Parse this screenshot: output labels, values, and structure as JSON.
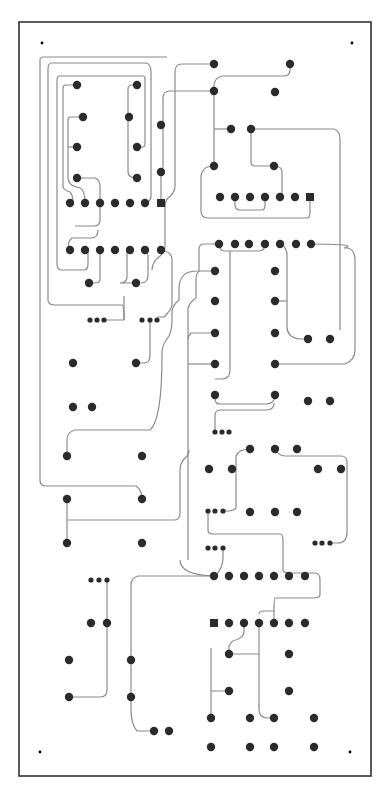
{
  "diagram": {
    "type": "pcb-layout",
    "board": {
      "x": 19,
      "y": 22,
      "w": 352,
      "h": 754,
      "stroke": "#333333"
    },
    "colors": {
      "pad": "#2b2b2b",
      "trace": "#8a8a8a",
      "background": "#ffffff"
    },
    "mount_holes": [
      [
        42,
        43
      ],
      [
        352,
        43
      ],
      [
        40,
        752
      ],
      [
        350,
        752
      ]
    ],
    "pads_round": [
      [
        77,
        85
      ],
      [
        137,
        85
      ],
      [
        83,
        117
      ],
      [
        129,
        117
      ],
      [
        77,
        147
      ],
      [
        137,
        147
      ],
      [
        77,
        178
      ],
      [
        137,
        178
      ],
      [
        70,
        203
      ],
      [
        85,
        203
      ],
      [
        100,
        203
      ],
      [
        115,
        203
      ],
      [
        130,
        203
      ],
      [
        145,
        203
      ],
      [
        161,
        125
      ],
      [
        161,
        172
      ],
      [
        70,
        250
      ],
      [
        85,
        250
      ],
      [
        100,
        250
      ],
      [
        115,
        250
      ],
      [
        130,
        250
      ],
      [
        145,
        250
      ],
      [
        161,
        250
      ],
      [
        89,
        283
      ],
      [
        136,
        283
      ],
      [
        73,
        363
      ],
      [
        136,
        363
      ],
      [
        73,
        407
      ],
      [
        92,
        407
      ],
      [
        214,
        64
      ],
      [
        290,
        64
      ],
      [
        214,
        91
      ],
      [
        275,
        92
      ],
      [
        231,
        129
      ],
      [
        251,
        129
      ],
      [
        214,
        166
      ],
      [
        274,
        166
      ],
      [
        220,
        197
      ],
      [
        235,
        197
      ],
      [
        250,
        197
      ],
      [
        265,
        197
      ],
      [
        280,
        197
      ],
      [
        295,
        197
      ],
      [
        219,
        244
      ],
      [
        235,
        244
      ],
      [
        249,
        244
      ],
      [
        265,
        244
      ],
      [
        280,
        244
      ],
      [
        296,
        244
      ],
      [
        311,
        244
      ],
      [
        215,
        271
      ],
      [
        275,
        271
      ],
      [
        215,
        301
      ],
      [
        275,
        301
      ],
      [
        215,
        333
      ],
      [
        275,
        333
      ],
      [
        308,
        339
      ],
      [
        330,
        339
      ],
      [
        215,
        364
      ],
      [
        275,
        364
      ],
      [
        215,
        395
      ],
      [
        275,
        395
      ],
      [
        308,
        401
      ],
      [
        330,
        401
      ],
      [
        67,
        456
      ],
      [
        142,
        456
      ],
      [
        67,
        499
      ],
      [
        142,
        499
      ],
      [
        67,
        543
      ],
      [
        142,
        543
      ],
      [
        250,
        449
      ],
      [
        275,
        449
      ],
      [
        297,
        449
      ],
      [
        209,
        469
      ],
      [
        232,
        469
      ],
      [
        318,
        469
      ],
      [
        341,
        469
      ],
      [
        250,
        512
      ],
      [
        275,
        512
      ],
      [
        297,
        512
      ],
      [
        214,
        576
      ],
      [
        229,
        576
      ],
      [
        244,
        576
      ],
      [
        259,
        576
      ],
      [
        274,
        576
      ],
      [
        289,
        576
      ],
      [
        305,
        576
      ],
      [
        91,
        623
      ],
      [
        107,
        623
      ],
      [
        69,
        660
      ],
      [
        131,
        660
      ],
      [
        69,
        697
      ],
      [
        131,
        697
      ],
      [
        154,
        731
      ],
      [
        169,
        731
      ],
      [
        229,
        623
      ],
      [
        244,
        623
      ],
      [
        259,
        623
      ],
      [
        274,
        623
      ],
      [
        289,
        623
      ],
      [
        305,
        623
      ],
      [
        229,
        654
      ],
      [
        289,
        654
      ],
      [
        229,
        691
      ],
      [
        289,
        691
      ],
      [
        211,
        718
      ],
      [
        250,
        718
      ],
      [
        274,
        718
      ],
      [
        314,
        718
      ],
      [
        211,
        747
      ],
      [
        250,
        747
      ],
      [
        274,
        747
      ],
      [
        314,
        747
      ]
    ],
    "pads_square": [
      [
        161,
        203
      ],
      [
        310,
        197
      ],
      [
        214,
        623
      ]
    ],
    "pads_small": [
      [
        90,
        320
      ],
      [
        97,
        320
      ],
      [
        104,
        320
      ],
      [
        142,
        320
      ],
      [
        150,
        320
      ],
      [
        157,
        320
      ],
      [
        215,
        432
      ],
      [
        222,
        432
      ],
      [
        229,
        432
      ],
      [
        208,
        511
      ],
      [
        215,
        511
      ],
      [
        223,
        511
      ],
      [
        315,
        543
      ],
      [
        322,
        543
      ],
      [
        330,
        543
      ],
      [
        208,
        548
      ],
      [
        215,
        548
      ],
      [
        223,
        548
      ],
      [
        91,
        580
      ],
      [
        99,
        580
      ],
      [
        107,
        580
      ]
    ],
    "traces": [
      "M77,85 H66 Q63,85 63,88 V186 Q63,190 70,192 Q73,195 73,203",
      "M83,117 H71 Q68,117 68,120 V178 Q68,186 80,188 Q85,190 85,203",
      "M77,147 H68",
      "M77,178 H95 Q100,180 100,186 V220 Q100,226 94,226 H75",
      "M137,85 H132 Q128,85 128,89 V172 Q128,178 137,178",
      "M137,147 H143 Q145,147 145,143 V78 Q145,76 142,76 H60 Q57,76 57,80 V264 Q57,270 62,270 H84 Q88,270 88,264 V250",
      "M161,172 V203",
      "M145,203 Q151,202 151,196 V72 Q151,63 145,63 H52 Q48,63 48,69 V300 Q48,305 55,305 H122 Q124,305 124,320",
      "M161,125 V125",
      "M214,64 H182 Q175,64 175,72 V186 Q175,193 168,198 Q165,201 165,208 V246 Q165,252 160,256 Q152,262 152,270",
      "M214,91 H170 Q163,91 163,98 V168",
      "M290,64 V70 Q290,76 284,76 H222 Q214,78 214,86 V166",
      "M214,129 H231",
      "M251,129 H334 Q340,131 340,139 V330",
      "M251,129 V162 Q251,166 255,166 H274 Q282,166 282,172 V197",
      "M214,166 Q201,166 201,178 V211 Q201,218 208,218 H307 Q310,218 310,212 V197",
      "M235,197 V205 Q235,210 240,210 H262 Q265,210 265,205 V197",
      "M130,250 Q127,250 127,253 V277 Q127,283 120,283 H136",
      "M100,250 V280 Q100,283 94,283 H89",
      "M70,250 Q66,243 72,238 H91 Q98,238 98,230",
      "M145,250 Q148,250 148,258 V275 Q148,283 141,283",
      "M161,250 Q172,252 172,259 V305 Q172,309 164,317 H157",
      "M104,320 H124 V296",
      "M150,320 V355 Q150,363 144,363 H136",
      "M219,244 Q219,251 225,251 H259 Q265,251 265,244",
      "M230,251 V370 Q230,379 222,379 H215 M219,244 H204 Q200,244 199,248 V271 Q186,271 183,276 Q179,281 179,289 V300 Q173,305 172,311 V320 Q172,330 169,336 Q162,345 162,352 V355 Q162,420 150,430 H75 Q67,432 67,440 V456",
      "M215,271 H200 Q196,272 196,280 V298 Q190,302 188,308 V560",
      "M215,333 H191 Q188,336 188,340",
      "M215,364 H188",
      "M281,244 Q287,248 287,255 V327 Q287,337 299,339 H308",
      "M275,301 H287",
      "M311,244 Q360,244 344,248 H348 Q355,250 355,260 V350 Q355,360 345,364 H275",
      "M215,395 V399 Q215,404 220,404 H266 Q275,404 275,395",
      "M215,432 V415 Q215,410 221,410 H266 Q274,410 274,403",
      "M250,449 Q239,449 236,456 V507 Q236,510 229,511 H223",
      "M275,449 Q279,456 285,456 H341 Q347,456 347,462 V532 Q347,543 338,543 H330",
      "M208,511 V530 Q208,534 213,534 H280 Q283,534 283,540 V570 Q283,573 290,573 H315 Q320,573 320,580 V595 Q320,598 313,598 H275 Q274,598 274,610 V623",
      "M223,548 V558 Q223,568 215,576 M214,576 H138 Q131,578 131,585 V690 Q131,697 131,710 Q131,724 137,731 H154",
      "M244,623 V632 Q244,637 236,640 Q232,640 229,646 V654",
      "M211,648 V718 M211,691 H229 M229,654 H259 M259,623 V709 Q259,718 267,718 H274",
      "M259,614 Q259,611 264,611 H274",
      "M107,580 V690 Q107,697 100,697 H69",
      "M142,499 Q142,490 136,486 H46 Q40,486 40,480 V60 Q40,57 44,57 H167",
      "M67,499 V543 M67,520 H175 Q180,520 180,512 V470 Q180,463 185,458 Q189,455 189,450",
      "M180,560 Q180,575 214,576"
    ]
  }
}
